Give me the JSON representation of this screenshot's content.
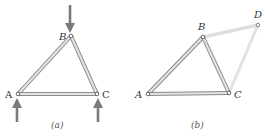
{
  "figure_a": {
    "caption": "(a)",
    "labels": {
      "A": "A",
      "B": "B",
      "C": "C"
    },
    "nodes": {
      "A": [
        18,
        94
      ],
      "B": [
        71,
        36
      ],
      "C": [
        97,
        94
      ]
    },
    "members": [
      [
        "A",
        "B"
      ],
      [
        "B",
        "C"
      ],
      [
        "A",
        "C"
      ]
    ],
    "forces": [
      {
        "at": "B",
        "direction": "down",
        "from": [
          70,
          5
        ],
        "to": [
          70,
          32
        ]
      },
      {
        "at": "A",
        "direction": "up",
        "from": [
          17,
          121
        ],
        "to": [
          17,
          99
        ]
      },
      {
        "at": "C",
        "direction": "up",
        "from": [
          98,
          121
        ],
        "to": [
          98,
          99
        ]
      }
    ]
  },
  "figure_b": {
    "caption": "(b)",
    "labels": {
      "A": "A",
      "B": "B",
      "C": "C",
      "D": "D"
    },
    "nodes": {
      "A": [
        148,
        94
      ],
      "B": [
        203,
        37
      ],
      "C": [
        229,
        93
      ],
      "D": [
        258,
        25
      ]
    },
    "members": [
      [
        "A",
        "B"
      ],
      [
        "B",
        "C"
      ],
      [
        "A",
        "C"
      ]
    ],
    "faded_members": [
      [
        "B",
        "D"
      ],
      [
        "C",
        "D"
      ]
    ]
  },
  "colors": {
    "member": "#b8b8b8",
    "member_edge": "#8a8a8a",
    "faded_member": "#dcdcdc",
    "arrow": "#7a7a7a",
    "label": "#333333"
  }
}
